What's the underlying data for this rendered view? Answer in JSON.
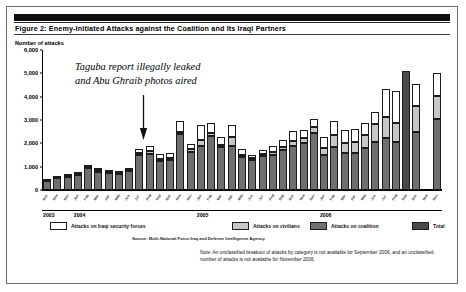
{
  "figure": {
    "title": "Figure 2: Enemy-Initiated Attacks against the Coalition and Its Iraqi Partners",
    "axis_label": "Number of attacks",
    "source": "Source: Multi-National Force-Iraq and Defense Intelligence Agency.",
    "note": "Note: An unclassified breakout of attacks by category is not available for September 2006, and an unclassified number of attacks is not available for November 2006.",
    "annotation_line1": "Taguba report illegally leaked",
    "annotation_line2": "and Abu Ghraib photos aired",
    "arrow_icon": "down-arrow-icon"
  },
  "colors": {
    "isf": "#ffffff",
    "civilians": "#c6c6c6",
    "coalition": "#6f6f6f",
    "total": "#4a4a4a",
    "axis": "#000000",
    "title_band": "#101010"
  },
  "legend": {
    "items": [
      {
        "label": "Attacks on Iraqi security forces",
        "key": "isf",
        "color": "#ffffff"
      },
      {
        "label": "Attacks on civilians",
        "key": "civilians",
        "color": "#c6c6c6"
      },
      {
        "label": "Attacks on coalition",
        "key": "coalition",
        "color": "#6f6f6f"
      },
      {
        "label": "Total",
        "key": "total",
        "color": "#4a4a4a"
      }
    ]
  },
  "chart_data": {
    "type": "bar",
    "stacked": true,
    "title": "Figure 2: Enemy-Initiated Attacks against the Coalition and Its Iraqi Partners",
    "xlabel": "",
    "ylabel": "Number of attacks",
    "ylim": [
      0,
      6000
    ],
    "yticks": [
      0,
      1000,
      2000,
      3000,
      4000,
      5000,
      6000
    ],
    "ytick_labels": [
      "0",
      "1,000",
      "2,000",
      "3,000",
      "4,000",
      "5,000",
      "6,000"
    ],
    "grid": false,
    "legend_position": "below",
    "year_bands": [
      {
        "label": "2003",
        "start_index": 0,
        "end_index": 2
      },
      {
        "label": "2004",
        "start_index": 3,
        "end_index": 14
      },
      {
        "label": "2005",
        "start_index": 15,
        "end_index": 26
      },
      {
        "label": "2006",
        "start_index": 27,
        "end_index": 38
      }
    ],
    "categories": [
      "Oct",
      "Nov",
      "Dec",
      "Jan",
      "Feb",
      "Mar",
      "Apr",
      "May",
      "Jun",
      "Jul",
      "Aug",
      "Sep",
      "Oct",
      "Nov",
      "Dec",
      "Jan",
      "Feb",
      "Mar",
      "Apr",
      "May",
      "Jun",
      "Jul",
      "Aug",
      "Sep",
      "Oct",
      "Nov",
      "Dec",
      "Jan",
      "Feb",
      "Mar",
      "Apr",
      "May",
      "Jun",
      "Jul",
      "Aug",
      "Sep",
      "Oct",
      "Nov",
      "Dec"
    ],
    "series": [
      {
        "name": "Attacks on coalition",
        "key": "coalition",
        "values": [
          380,
          500,
          560,
          640,
          950,
          790,
          720,
          690,
          800,
          1500,
          1560,
          1250,
          1300,
          2380,
          1640,
          1900,
          2330,
          1830,
          1870,
          1420,
          1300,
          1450,
          1520,
          1700,
          1900,
          2020,
          2460,
          1520,
          1830,
          1600,
          1570,
          1800,
          2060,
          2240,
          2060,
          2540,
          2480,
          null,
          3050
        ]
      },
      {
        "name": "Attacks on civilians",
        "key": "civilians",
        "values": [
          20,
          25,
          30,
          35,
          45,
          50,
          40,
          35,
          40,
          90,
          110,
          100,
          90,
          120,
          120,
          240,
          130,
          120,
          420,
          100,
          80,
          90,
          120,
          150,
          190,
          230,
          250,
          300,
          520,
          420,
          470,
          560,
          760,
          880,
          810,
          1100,
          1100,
          null,
          960
        ]
      },
      {
        "name": "Attacks on Iraqi security forces",
        "key": "isf",
        "values": [
          20,
          25,
          30,
          45,
          55,
          70,
          60,
          55,
          60,
          170,
          200,
          180,
          190,
          450,
          200,
          660,
          420,
          310,
          500,
          240,
          140,
          190,
          230,
          290,
          430,
          330,
          320,
          450,
          590,
          560,
          590,
          530,
          510,
          1200,
          1370,
          960,
          980,
          null,
          1000
        ]
      }
    ],
    "totals_unbroken": [
      null,
      null,
      null,
      null,
      null,
      null,
      null,
      null,
      null,
      null,
      null,
      null,
      null,
      null,
      null,
      null,
      null,
      null,
      null,
      null,
      null,
      null,
      null,
      null,
      null,
      null,
      null,
      null,
      null,
      null,
      null,
      null,
      null,
      null,
      null,
      5100,
      null,
      null,
      null
    ],
    "missing_months": [
      "Nov 2006"
    ],
    "unbroken_months": [
      "Sep 2006"
    ],
    "annotation": {
      "text": "Taguba report illegally leaked and Abu Ghraib photos aired",
      "points_to_index": 6
    }
  }
}
